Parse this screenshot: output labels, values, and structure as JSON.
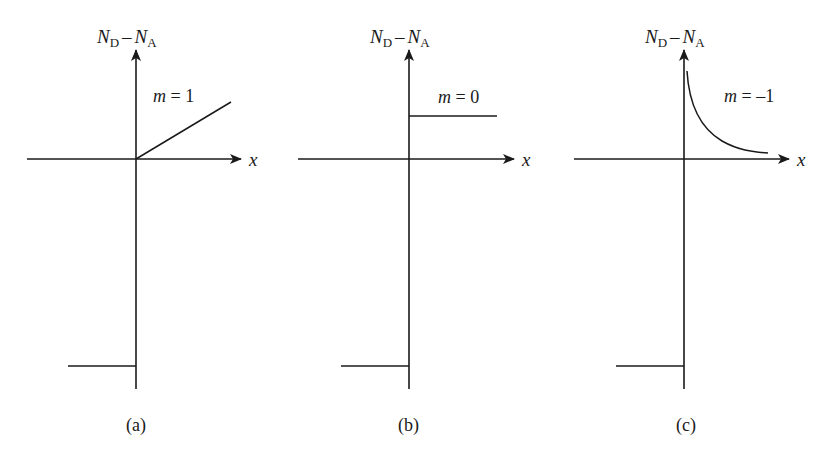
{
  "figure": {
    "panels": [
      {
        "id": "a",
        "caption": "(a)",
        "y_axis_label": {
          "var1": "N",
          "sub1": "D",
          "minus": "–",
          "var2": "N",
          "sub2": "A"
        },
        "x_axis_label": "x",
        "curve_label": {
          "var": "m",
          "eq": " = ",
          "value": "1"
        },
        "profile": "linear",
        "description": "Linearly graded profile starting at origin, rising to the right; constant negative step for x<0"
      },
      {
        "id": "b",
        "caption": "(b)",
        "y_axis_label": {
          "var1": "N",
          "sub1": "D",
          "minus": "–",
          "var2": "N",
          "sub2": "A"
        },
        "x_axis_label": "x",
        "curve_label": {
          "var": "m",
          "eq": " = ",
          "value": "0"
        },
        "profile": "constant",
        "description": "Abrupt (step) junction: constant positive level for x>0, constant negative level for x<0"
      },
      {
        "id": "c",
        "caption": "(c)",
        "y_axis_label": {
          "var1": "N",
          "sub1": "D",
          "minus": "–",
          "var2": "N",
          "sub2": "A"
        },
        "x_axis_label": "x",
        "curve_label": {
          "var": "m",
          "eq": " = ",
          "value": "–1"
        },
        "profile": "hyperabrupt",
        "description": "Hyperabrupt profile decaying as 1/x for x>0; constant negative step for x<0"
      }
    ],
    "colors": {
      "stroke": "#1a1a1a",
      "background": "#ffffff"
    }
  }
}
